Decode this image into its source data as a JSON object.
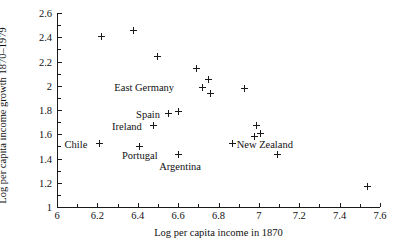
{
  "chart_data": {
    "type": "scatter",
    "title": "",
    "xlabel": "Log per capita income in 1870",
    "ylabel": "Log per capita income growth 1870–1979",
    "xlim": [
      6,
      7.6
    ],
    "ylim": [
      1,
      2.6
    ],
    "grid": false,
    "legend": "none",
    "x_ticks": [
      "6",
      "6.2",
      "6.4",
      "6.6",
      "6.8",
      "7",
      "7.2",
      "7.4",
      "7.6"
    ],
    "x_tick_values": [
      6,
      6.2,
      6.4,
      6.6,
      6.8,
      7,
      7.2,
      7.4,
      7.6
    ],
    "y_ticks": [
      "1",
      "1.2",
      "1.4",
      "1.6",
      "1.8",
      "2",
      "2.2",
      "2.4",
      "2.6"
    ],
    "y_tick_values": [
      1,
      1.2,
      1.4,
      1.6,
      1.8,
      2,
      2.2,
      2.4,
      2.6
    ],
    "marker": "plus",
    "marker_color": "#1a1a1a",
    "points": [
      {
        "x": 6.22,
        "y": 2.41
      },
      {
        "x": 6.38,
        "y": 2.46
      },
      {
        "x": 6.5,
        "y": 2.24
      },
      {
        "x": 6.69,
        "y": 2.14
      },
      {
        "x": 6.75,
        "y": 2.05
      },
      {
        "x": 6.72,
        "y": 1.99
      },
      {
        "x": 6.76,
        "y": 1.94
      },
      {
        "x": 6.93,
        "y": 1.98
      },
      {
        "x": 6.99,
        "y": 1.67
      },
      {
        "x": 6.98,
        "y": 1.58
      },
      {
        "x": 7.01,
        "y": 1.61
      },
      {
        "x": 7.09,
        "y": 1.43
      },
      {
        "x": 6.55,
        "y": 1.77
      },
      {
        "x": 6.6,
        "y": 1.79
      },
      {
        "x": 6.48,
        "y": 1.67
      },
      {
        "x": 6.21,
        "y": 1.52
      },
      {
        "x": 6.41,
        "y": 1.5
      },
      {
        "x": 6.6,
        "y": 1.43
      },
      {
        "x": 6.87,
        "y": 1.52
      },
      {
        "x": 7.54,
        "y": 1.17
      }
    ],
    "annotations": [
      {
        "label": "East Germany",
        "x": 6.58,
        "y": 1.99,
        "anchor": "right"
      },
      {
        "label": "Spain",
        "x": 6.51,
        "y": 1.77,
        "anchor": "right"
      },
      {
        "label": "Ireland",
        "x": 6.42,
        "y": 1.67,
        "anchor": "right"
      },
      {
        "label": "Chile",
        "x": 6.15,
        "y": 1.52,
        "anchor": "right"
      },
      {
        "label": "Portugal",
        "x": 6.41,
        "y": 1.43,
        "anchor": "center"
      },
      {
        "label": "Argentina",
        "x": 6.61,
        "y": 1.34,
        "anchor": "center"
      },
      {
        "label": "New Zealand",
        "x": 6.89,
        "y": 1.52,
        "anchor": "left"
      }
    ]
  }
}
